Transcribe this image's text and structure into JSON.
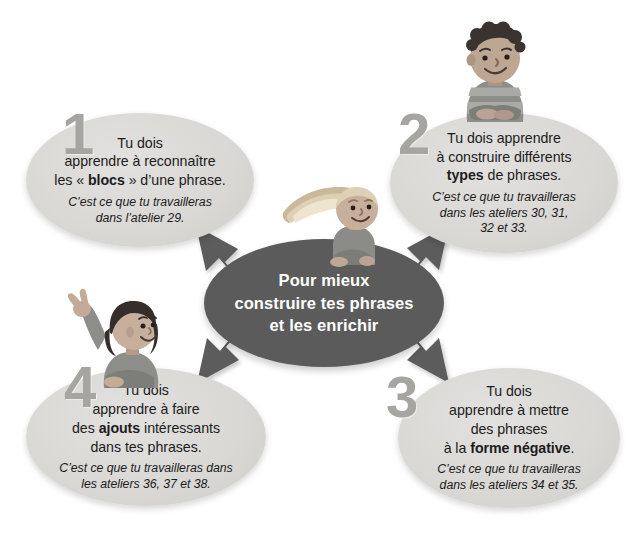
{
  "page": {
    "language": "fr",
    "background_color": "#ffffff",
    "palette": {
      "center_fill": "#5b5b5b",
      "center_text": "#ffffff",
      "bubble_fill": "#d9d8d5",
      "bubble_text": "#1c1c1c",
      "arrow_fill": "#5b5b5b",
      "number_color": "#a6a5a2"
    }
  },
  "center": {
    "line1": "Pour mieux",
    "line2": "construire tes phrases",
    "line3": "et les enrichir"
  },
  "steps": [
    {
      "number": "1",
      "main_parts": [
        {
          "text": "Tu dois",
          "bold": false,
          "break_after": true
        },
        {
          "text": "apprendre à reconnaître",
          "bold": false,
          "break_after": true
        },
        {
          "text": "les « ",
          "bold": false,
          "break_after": false
        },
        {
          "text": "blocs",
          "bold": true,
          "break_after": false
        },
        {
          "text": " » d’une phrase.",
          "bold": false,
          "break_after": false
        }
      ],
      "sub_lines": [
        "C’est ce que tu travailleras",
        "dans l’atelier 29."
      ]
    },
    {
      "number": "2",
      "main_parts": [
        {
          "text": "Tu dois apprendre",
          "bold": false,
          "break_after": true
        },
        {
          "text": "à construire différents",
          "bold": false,
          "break_after": true
        },
        {
          "text": "types",
          "bold": true,
          "break_after": false
        },
        {
          "text": " de phrases.",
          "bold": false,
          "break_after": false
        }
      ],
      "sub_lines": [
        "C’est ce que tu travailleras",
        "dans les ateliers 30, 31,",
        "32 et 33."
      ]
    },
    {
      "number": "3",
      "main_parts": [
        {
          "text": "Tu dois",
          "bold": false,
          "break_after": true
        },
        {
          "text": "apprendre à mettre",
          "bold": false,
          "break_after": true
        },
        {
          "text": "des phrases",
          "bold": false,
          "break_after": true
        },
        {
          "text": "à la ",
          "bold": false,
          "break_after": false
        },
        {
          "text": "forme négative",
          "bold": true,
          "break_after": false
        },
        {
          "text": ".",
          "bold": false,
          "break_after": false
        }
      ],
      "sub_lines": [
        "C’est ce que tu travailleras",
        "dans les ateliers 34 et 35."
      ]
    },
    {
      "number": "4",
      "main_parts": [
        {
          "text": "Tu dois",
          "bold": false,
          "break_after": true
        },
        {
          "text": "apprendre à faire",
          "bold": false,
          "break_after": true
        },
        {
          "text": "des ",
          "bold": false,
          "break_after": false
        },
        {
          "text": "ajouts",
          "bold": true,
          "break_after": false
        },
        {
          "text": " intéressants",
          "bold": false,
          "break_after": true
        },
        {
          "text": "dans tes phrases.",
          "bold": false,
          "break_after": false
        }
      ],
      "sub_lines": [
        "C’est ce que tu travailleras dans",
        "les ateliers 36, 37 et 38."
      ]
    }
  ],
  "characters": [
    {
      "name": "boy-arms-crossed",
      "position": "top-right",
      "description": "garçon aux cheveux bouclés, bras croisés"
    },
    {
      "name": "girl-long-hair",
      "position": "center",
      "description": "fille aux cheveux longs penchée sur l’ellipse"
    },
    {
      "name": "girl-waving",
      "position": "left",
      "description": "fille qui fait un signe de la main"
    }
  ],
  "arrows": [
    {
      "name": "arrow-to-step-1",
      "direction": "up-left"
    },
    {
      "name": "arrow-to-step-2",
      "direction": "up-right"
    },
    {
      "name": "arrow-to-step-3",
      "direction": "down-right"
    },
    {
      "name": "arrow-to-step-4",
      "direction": "down-left"
    }
  ]
}
